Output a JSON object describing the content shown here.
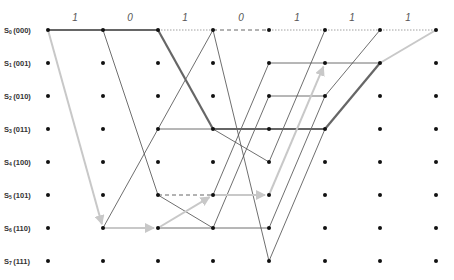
{
  "diagram": {
    "type": "trellis",
    "columns_x": [
      48,
      103,
      158,
      213,
      269,
      325,
      380,
      436
    ],
    "rows_y": [
      30,
      63,
      96,
      129,
      162,
      195,
      228,
      261
    ],
    "input_bits": [
      "1",
      "0",
      "1",
      "0",
      "1",
      "1",
      "1"
    ],
    "input_bit_positions": [
      {
        "x": 75,
        "y": 21
      },
      {
        "x": 130,
        "y": 21
      },
      {
        "x": 185,
        "y": 21
      },
      {
        "x": 241,
        "y": 21
      },
      {
        "x": 297,
        "y": 21
      },
      {
        "x": 352,
        "y": 21
      },
      {
        "x": 408,
        "y": 21
      }
    ],
    "states": [
      {
        "name": "S",
        "sub": "0",
        "bits": "(000)"
      },
      {
        "name": "S",
        "sub": "1",
        "bits": "(001)"
      },
      {
        "name": "S",
        "sub": "2",
        "bits": "(010)"
      },
      {
        "name": "S",
        "sub": "3",
        "bits": "(011)"
      },
      {
        "name": "S",
        "sub": "4",
        "bits": "(100)"
      },
      {
        "name": "S",
        "sub": "5",
        "bits": "(101)"
      },
      {
        "name": "S",
        "sub": "6",
        "bits": "(110)"
      },
      {
        "name": "S",
        "sub": "7",
        "bits": "(111)"
      }
    ],
    "edges": [
      {
        "from_col": 0,
        "from": 0,
        "to": 0,
        "style": "path"
      },
      {
        "from_col": 0,
        "from": 0,
        "to": 6,
        "style": "gray-arrow"
      },
      {
        "from_col": 1,
        "from": 0,
        "to": 0,
        "style": "path"
      },
      {
        "from_col": 1,
        "from": 0,
        "to": 5,
        "style": "thin"
      },
      {
        "from_col": 1,
        "from": 6,
        "to": 3,
        "style": "thin"
      },
      {
        "from_col": 1,
        "from": 6,
        "to": 6,
        "style": "gray-arrow"
      },
      {
        "from_col": 2,
        "from": 0,
        "to": 0,
        "style": "dotted"
      },
      {
        "from_col": 2,
        "from": 0,
        "to": 3,
        "style": "path"
      },
      {
        "from_col": 2,
        "from": 3,
        "to": 0,
        "style": "thin"
      },
      {
        "from_col": 2,
        "from": 3,
        "to": 3,
        "style": "thin"
      },
      {
        "from_col": 2,
        "from": 5,
        "to": 5,
        "style": "dashed"
      },
      {
        "from_col": 2,
        "from": 5,
        "to": 6,
        "style": "thin"
      },
      {
        "from_col": 2,
        "from": 6,
        "to": 5,
        "style": "gray-arrow"
      },
      {
        "from_col": 2,
        "from": 6,
        "to": 6,
        "style": "thin"
      },
      {
        "from_col": 3,
        "from": 0,
        "to": 0,
        "style": "dashed"
      },
      {
        "from_col": 3,
        "from": 0,
        "to": 7,
        "style": "thin"
      },
      {
        "from_col": 3,
        "from": 3,
        "to": 3,
        "style": "path"
      },
      {
        "from_col": 3,
        "from": 3,
        "to": 4,
        "style": "thin"
      },
      {
        "from_col": 3,
        "from": 5,
        "to": 1,
        "style": "thin"
      },
      {
        "from_col": 3,
        "from": 5,
        "to": 5,
        "style": "gray-arrow"
      },
      {
        "from_col": 3,
        "from": 6,
        "to": 2,
        "style": "thin"
      },
      {
        "from_col": 3,
        "from": 6,
        "to": 6,
        "style": "thin"
      },
      {
        "from_col": 4,
        "from": 0,
        "to": 0,
        "style": "dotted"
      },
      {
        "from_col": 4,
        "from": 1,
        "to": 1,
        "style": "thin"
      },
      {
        "from_col": 4,
        "from": 2,
        "to": 2,
        "style": "thin"
      },
      {
        "from_col": 4,
        "from": 3,
        "to": 3,
        "style": "path"
      },
      {
        "from_col": 4,
        "from": 4,
        "to": 0,
        "style": "thin"
      },
      {
        "from_col": 4,
        "from": 5,
        "to": 1,
        "style": "gray-arrow"
      },
      {
        "from_col": 4,
        "from": 6,
        "to": 2,
        "style": "thin"
      },
      {
        "from_col": 4,
        "from": 7,
        "to": 3,
        "style": "thin"
      },
      {
        "from_col": 5,
        "from": 0,
        "to": 0,
        "style": "dotted"
      },
      {
        "from_col": 5,
        "from": 1,
        "to": 1,
        "style": "thin"
      },
      {
        "from_col": 5,
        "from": 2,
        "to": 0,
        "style": "thin"
      },
      {
        "from_col": 5,
        "from": 3,
        "to": 1,
        "style": "path"
      },
      {
        "from_col": 6,
        "from": 0,
        "to": 0,
        "style": "dotted"
      },
      {
        "from_col": 6,
        "from": 1,
        "to": 0,
        "style": "gray-path"
      }
    ]
  }
}
